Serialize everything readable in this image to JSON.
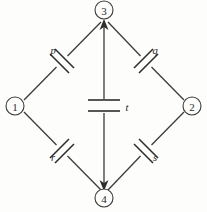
{
  "diagram": {
    "type": "circuit-schematic",
    "background_color": "#fdfdfc",
    "line_color": "#3b3b3b",
    "label_color": "#242424",
    "nodes": [
      {
        "id": "node-1",
        "label": "1",
        "x": 15,
        "y": 106,
        "radius": 9
      },
      {
        "id": "node-2",
        "label": "2",
        "x": 192,
        "y": 106,
        "radius": 9
      },
      {
        "id": "node-3",
        "label": "3",
        "x": 104,
        "y": 10,
        "radius": 9
      },
      {
        "id": "node-4",
        "label": "4",
        "x": 104,
        "y": 198,
        "radius": 9
      }
    ],
    "branches": [
      {
        "id": "branch-p",
        "label": "p",
        "from": "node-1",
        "to": "node-3",
        "component": "capacitor",
        "x1": 26,
        "y1": 98,
        "x2": 99,
        "y2": 24,
        "label_x": 53,
        "label_y": 50
      },
      {
        "id": "branch-q",
        "label": "q",
        "from": "node-3",
        "to": "node-2",
        "component": "capacitor",
        "x1": 110,
        "y1": 24,
        "x2": 182,
        "y2": 98,
        "label_x": 155,
        "label_y": 50
      },
      {
        "id": "branch-r",
        "label": "r",
        "from": "node-1",
        "to": "node-4",
        "component": "capacitor",
        "x1": 26,
        "y1": 114,
        "x2": 99,
        "y2": 188,
        "label_x": 53,
        "label_y": 157
      },
      {
        "id": "branch-s",
        "label": "s",
        "from": "node-4",
        "to": "node-2",
        "component": "capacitor",
        "x1": 110,
        "y1": 188,
        "x2": 182,
        "y2": 114,
        "label_x": 155,
        "label_y": 157
      },
      {
        "id": "branch-t",
        "label": "t",
        "from": "node-3",
        "to": "node-4",
        "component": "capacitor",
        "x1": 104,
        "y1": 20,
        "x2": 104,
        "y2": 190,
        "label_x": 126,
        "label_y": 107
      }
    ]
  }
}
